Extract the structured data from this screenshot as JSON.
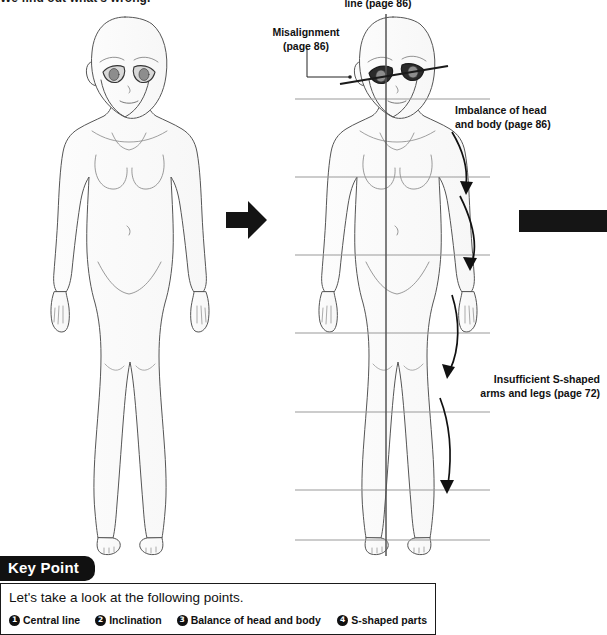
{
  "page": {
    "top_cut_text": "We find out what's wrong.",
    "width": 607,
    "height": 629
  },
  "annotations": {
    "central_line": "line (page 86)",
    "misalignment": "Misalignment\n(page 86)",
    "misalignment_l1": "Misalignment",
    "misalignment_l2": "(page 86)",
    "imbalance_l1": "Imbalance of head",
    "imbalance_l2": "and body (page 86)",
    "insufficient_l1": "Insufficient S-shaped",
    "insufficient_l2": "arms and legs (page 72)"
  },
  "figures": {
    "left": {
      "name": "correct-figure",
      "caption": ""
    },
    "right": {
      "name": "incorrect-figure",
      "guideline_count": 7,
      "has_central_line": true,
      "has_eye_line": true
    }
  },
  "key_point": {
    "tab_label": "Key Point",
    "lead": "Let's take a look at the following points.",
    "items": [
      {
        "num": "1",
        "label": "Central line"
      },
      {
        "num": "2",
        "label": "Inclination"
      },
      {
        "num": "3",
        "label": "Balance of head and body"
      },
      {
        "num": "4",
        "label": "S-shaped parts"
      }
    ]
  },
  "colors": {
    "ink": "#111111",
    "outline": "#4a4a4a",
    "fill": "#fbfbfb",
    "guideline": "#9a9a9a",
    "eye_fill": "#8d8d8d",
    "black_bar": "#151515"
  }
}
